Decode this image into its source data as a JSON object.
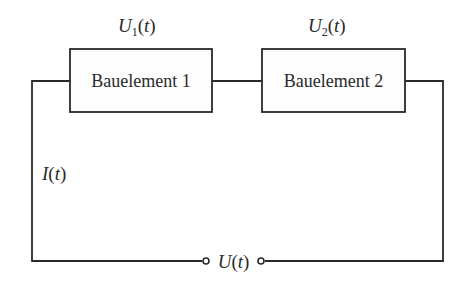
{
  "diagram": {
    "type": "series circuit",
    "components": [
      {
        "label": "Bauelement 1",
        "voltage_symbol": "U",
        "voltage_subscript": "1",
        "voltage_arg": "t"
      },
      {
        "label": "Bauelement 2",
        "voltage_symbol": "U",
        "voltage_subscript": "2",
        "voltage_arg": "t"
      }
    ],
    "current": {
      "symbol": "I",
      "arg": "t"
    },
    "source": {
      "symbol": "U",
      "arg": "t"
    },
    "colors": {
      "line": "#2a2a2a",
      "background": "#ffffff"
    }
  }
}
